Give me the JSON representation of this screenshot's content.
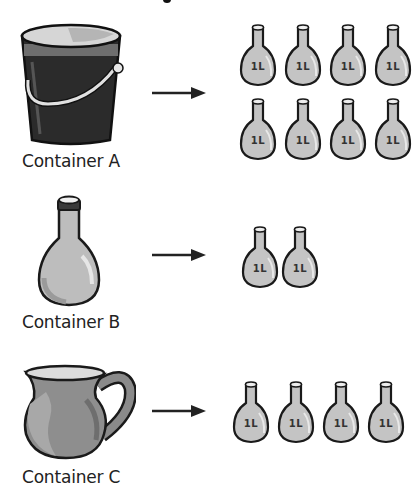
{
  "title_fragment": "",
  "unit_icon_label": "1L",
  "rows": [
    {
      "container_label": "Container A",
      "container_icon": "bucket-icon",
      "bottle_count": 8
    },
    {
      "container_label": "Container B",
      "container_icon": "bottle-icon",
      "bottle_count": 2
    },
    {
      "container_label": "Container C",
      "container_icon": "jug-icon",
      "bottle_count": 4
    }
  ],
  "colors": {
    "bucket_body": "#2b2b2b",
    "container_fill": "#b9b9b9",
    "jug_fill": "#8e8e8e",
    "bottle_fill": "#c4c4c4",
    "outline": "#1a1a1a",
    "arrow": "#222222"
  }
}
